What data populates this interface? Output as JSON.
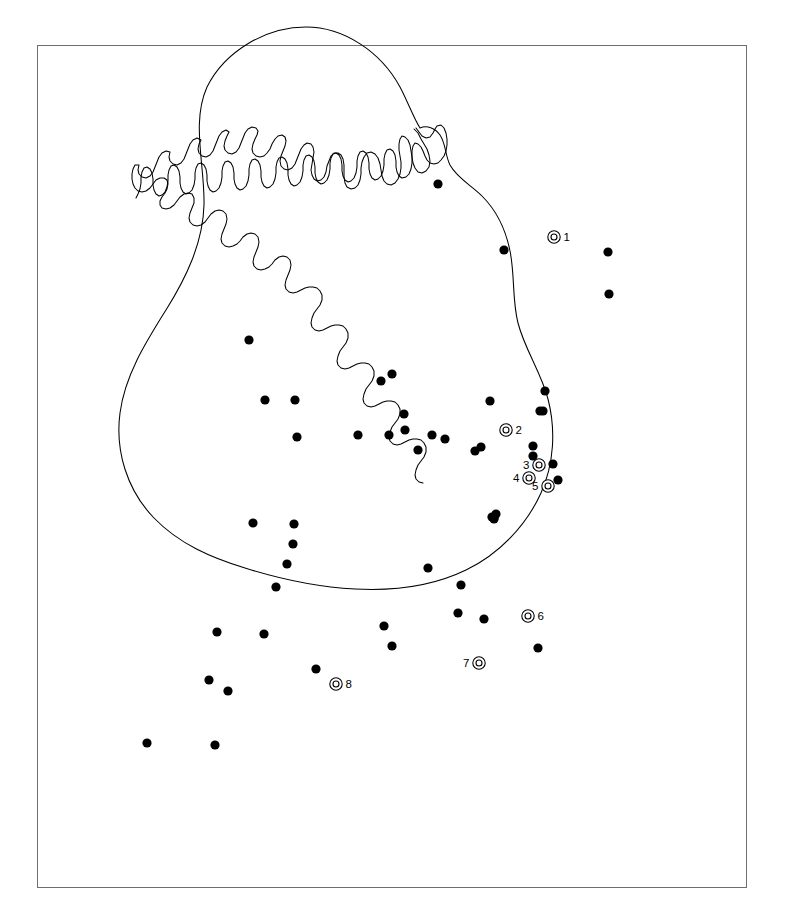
{
  "figure": {
    "background_color": "#ffffff",
    "frame": {
      "x": 37,
      "y": 45,
      "width": 710,
      "height": 843,
      "stroke_color": "#6e6e73",
      "stroke_width": 1
    }
  },
  "map": {
    "region_name": "Ireland",
    "coastline_color": "#000000",
    "fill_color": "#ffffff",
    "projection_note": "outline only, no graticule"
  },
  "legend": {
    "dot_symbol_name": "filled-circle",
    "dot_symbol_color": "#000000",
    "ring_symbol_name": "double-ring-circle",
    "ring_symbol_color": "#000000"
  },
  "chart_data": {
    "type": "scatter",
    "title": "",
    "xlabel": "",
    "ylabel": "",
    "grid": false,
    "legend_position": "none",
    "axis_visible": false,
    "series": [
      {
        "name": "unlabelled-sites",
        "symbol": "filled-circle",
        "color": "#000000",
        "count": 50,
        "points": [
          {
            "x": 438,
            "y": 184
          },
          {
            "x": 504,
            "y": 250
          },
          {
            "x": 608,
            "y": 252
          },
          {
            "x": 609,
            "y": 294
          },
          {
            "x": 249,
            "y": 340
          },
          {
            "x": 265,
            "y": 400
          },
          {
            "x": 381,
            "y": 381
          },
          {
            "x": 392,
            "y": 374
          },
          {
            "x": 295,
            "y": 400
          },
          {
            "x": 404,
            "y": 414
          },
          {
            "x": 490,
            "y": 401
          },
          {
            "x": 545,
            "y": 391
          },
          {
            "x": 543,
            "y": 411
          },
          {
            "x": 540,
            "y": 411
          },
          {
            "x": 297,
            "y": 437
          },
          {
            "x": 358,
            "y": 435
          },
          {
            "x": 389,
            "y": 435
          },
          {
            "x": 405,
            "y": 430
          },
          {
            "x": 432,
            "y": 435
          },
          {
            "x": 445,
            "y": 439
          },
          {
            "x": 418,
            "y": 450
          },
          {
            "x": 475,
            "y": 451
          },
          {
            "x": 481,
            "y": 447
          },
          {
            "x": 533,
            "y": 446
          },
          {
            "x": 533,
            "y": 456
          },
          {
            "x": 553,
            "y": 464
          },
          {
            "x": 558,
            "y": 480
          },
          {
            "x": 494,
            "y": 519
          },
          {
            "x": 494,
            "y": 518
          },
          {
            "x": 496,
            "y": 514
          },
          {
            "x": 492,
            "y": 517
          },
          {
            "x": 253,
            "y": 523
          },
          {
            "x": 294,
            "y": 524
          },
          {
            "x": 293,
            "y": 544
          },
          {
            "x": 287,
            "y": 564
          },
          {
            "x": 276,
            "y": 587
          },
          {
            "x": 428,
            "y": 568
          },
          {
            "x": 461,
            "y": 585
          },
          {
            "x": 217,
            "y": 632
          },
          {
            "x": 264,
            "y": 634
          },
          {
            "x": 384,
            "y": 626
          },
          {
            "x": 392,
            "y": 646
          },
          {
            "x": 458,
            "y": 613
          },
          {
            "x": 484,
            "y": 619
          },
          {
            "x": 538,
            "y": 648
          },
          {
            "x": 316,
            "y": 669
          },
          {
            "x": 209,
            "y": 680
          },
          {
            "x": 228,
            "y": 691
          },
          {
            "x": 147,
            "y": 743
          },
          {
            "x": 215,
            "y": 745
          }
        ]
      },
      {
        "name": "labelled-sites",
        "symbol": "double-ring-circle",
        "color": "#000000",
        "count": 8,
        "points": [
          {
            "id": 1,
            "label": "1",
            "x": 554,
            "y": 237,
            "label_side": "right"
          },
          {
            "id": 2,
            "label": "2",
            "x": 506,
            "y": 430,
            "label_side": "right"
          },
          {
            "id": 3,
            "label": "3",
            "x": 539,
            "y": 465,
            "label_side": "left"
          },
          {
            "id": 4,
            "label": "4",
            "x": 529,
            "y": 478,
            "label_side": "left"
          },
          {
            "id": 5,
            "label": "5",
            "x": 548,
            "y": 486,
            "label_side": "left"
          },
          {
            "id": 6,
            "label": "6",
            "x": 528,
            "y": 616,
            "label_side": "right"
          },
          {
            "id": 7,
            "label": "7",
            "x": 479,
            "y": 663,
            "label_side": "left"
          },
          {
            "id": 8,
            "label": "8",
            "x": 336,
            "y": 684,
            "label_side": "right"
          }
        ]
      }
    ]
  }
}
